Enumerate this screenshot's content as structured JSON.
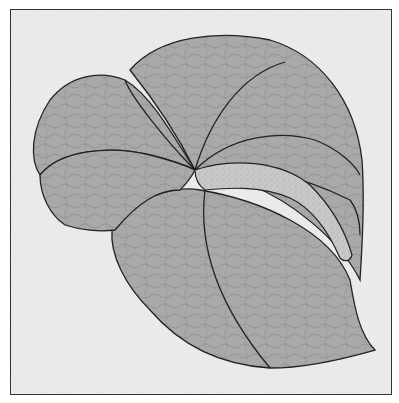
{
  "figure": {
    "colors": {
      "background": "#ededed",
      "frame_border": "#333333",
      "piece_fill": "#a9a9a9",
      "texture_line": "#8a8a8a",
      "stem_fill": "#c6c6c6",
      "outline": "#222222"
    }
  }
}
